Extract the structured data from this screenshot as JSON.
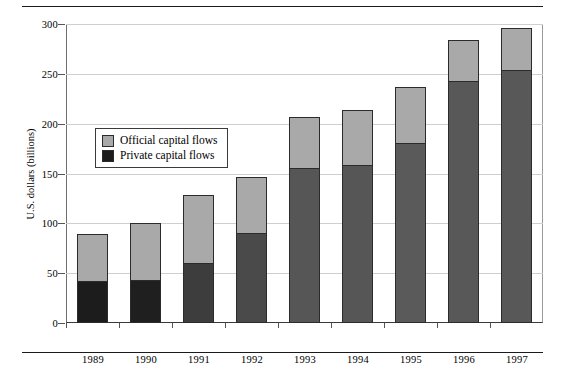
{
  "chart_data": {
    "type": "bar",
    "stacked": true,
    "title": "",
    "xlabel": "",
    "ylabel": "U.S. dollars (billions)",
    "ylim": [
      0,
      300
    ],
    "yticks": [
      0,
      50,
      100,
      150,
      200,
      250,
      300
    ],
    "ytick_labels": [
      "0",
      "50",
      "100",
      "150",
      "200",
      "250",
      "300"
    ],
    "grid": true,
    "grid_axis": "y",
    "legend_position": "upper left inside",
    "categories": [
      "1989",
      "1990",
      "1991",
      "1992",
      "1993",
      "1994",
      "1995",
      "1996",
      "1997"
    ],
    "series": [
      {
        "name": "Private capital flows",
        "color": "#2a2a2a",
        "values": [
          42,
          43,
          60,
          90,
          156,
          159,
          181,
          243,
          254
        ]
      },
      {
        "name": "Official capital flows",
        "color": "#a9a9a9",
        "values": [
          47,
          57,
          68,
          56,
          51,
          55,
          56,
          41,
          42
        ]
      }
    ],
    "totals": [
      89,
      100,
      128,
      146,
      207,
      214,
      237,
      284,
      296
    ],
    "bar_colors_private": [
      "#1c1c1c",
      "#1f1f1f",
      "#3d3d3d",
      "#4a4a4a",
      "#565656",
      "#565656",
      "#5a5a5a",
      "#585858",
      "#585858"
    ]
  },
  "legend": {
    "items": [
      {
        "label": "Official capital flows",
        "swatch": "#a9a9a9"
      },
      {
        "label": "Private capital flows",
        "swatch": "#1c1c1c"
      }
    ]
  }
}
